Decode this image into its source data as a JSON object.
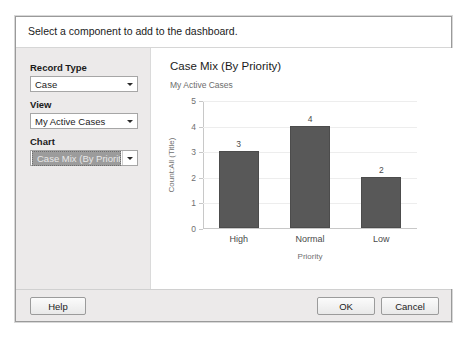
{
  "dialog": {
    "instruction": "Select a component to add to the dashboard."
  },
  "config_panel": {
    "fields": [
      {
        "label": "Record Type",
        "value": "Case",
        "selected": false,
        "arrow_icon": "chevron-down-icon"
      },
      {
        "label": "View",
        "value": "My Active Cases",
        "selected": false,
        "arrow_icon": "chevron-down-icon"
      },
      {
        "label": "Chart",
        "value": "Case Mix (By Priority)",
        "selected": true,
        "arrow_icon": "chevron-down-icon"
      }
    ]
  },
  "preview": {
    "title": "Case Mix (By Priority)",
    "subtitle": "My Active Cases"
  },
  "footer": {
    "help_label": "Help",
    "ok_label": "OK",
    "cancel_label": "Cancel"
  },
  "chart_data": {
    "type": "bar",
    "title": "Case Mix (By Priority)",
    "subtitle": "My Active Cases",
    "categories": [
      "High",
      "Normal",
      "Low"
    ],
    "values": [
      3,
      4,
      2
    ],
    "data_labels": [
      "3",
      "4",
      "2"
    ],
    "xlabel": "Priority",
    "ylabel": "Count:All (Title)",
    "ylim": [
      0,
      5
    ],
    "yticks": [
      0,
      1,
      2,
      3,
      4,
      5
    ],
    "ytick_labels": [
      "0",
      "1",
      "2",
      "3",
      "4",
      "5"
    ],
    "grid": true,
    "legend": false,
    "bar_color": "#585858",
    "axis_color": "#c8c8c8",
    "grid_color": "#ededed"
  }
}
